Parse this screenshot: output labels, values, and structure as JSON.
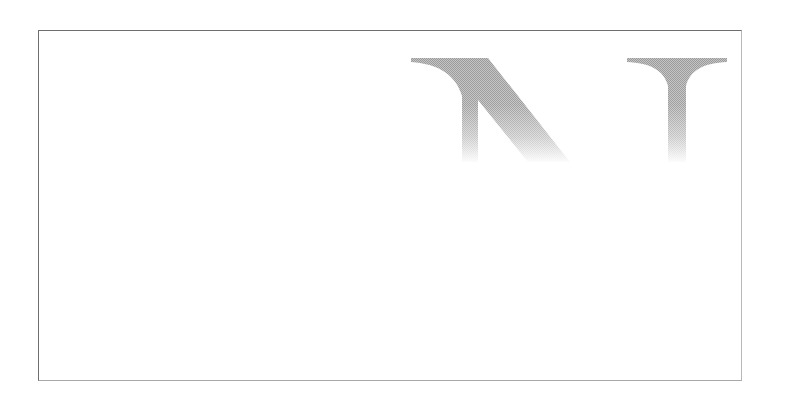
{
  "logo": {
    "letters": [
      "N",
      "T"
    ],
    "visible_text": "NT",
    "fill_color": "#a9a9a9",
    "fade": "halftone gradient fading toward bottom"
  },
  "frame": {
    "border_color": "#6e6e6e",
    "background": "#ffffff"
  }
}
